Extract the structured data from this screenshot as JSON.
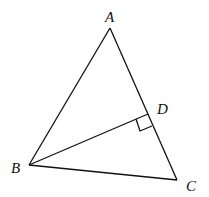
{
  "diagram": {
    "type": "geometry-triangle",
    "points": {
      "A": {
        "label": "A",
        "x": 110,
        "y": 28
      },
      "B": {
        "label": "B",
        "x": 29,
        "y": 165
      },
      "C": {
        "label": "C",
        "x": 177,
        "y": 180
      },
      "D": {
        "label": "D",
        "x": 148,
        "y": 115
      }
    },
    "segments": [
      "AB",
      "AC",
      "BC",
      "BD"
    ],
    "annotations": [
      "right angle at D between BD and AC"
    ]
  }
}
